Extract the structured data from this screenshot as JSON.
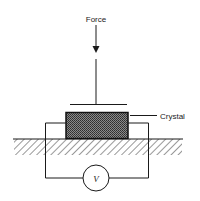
{
  "diagram": {
    "type": "piezoelectric-crystal-schematic",
    "labels": {
      "force": "Force",
      "crystal": "Crystal",
      "voltmeter": "V"
    },
    "components": [
      {
        "name": "force-arrow",
        "direction": "down"
      },
      {
        "name": "pressure-plate"
      },
      {
        "name": "crystal",
        "fill": "stippled-dark"
      },
      {
        "name": "ground-base",
        "fill": "hatched"
      },
      {
        "name": "voltmeter",
        "symbol": "V"
      },
      {
        "name": "wires",
        "count": 2
      }
    ],
    "colors": {
      "line": "#1a1a1a",
      "crystal_fill": "#555555",
      "background": "#ffffff"
    }
  }
}
